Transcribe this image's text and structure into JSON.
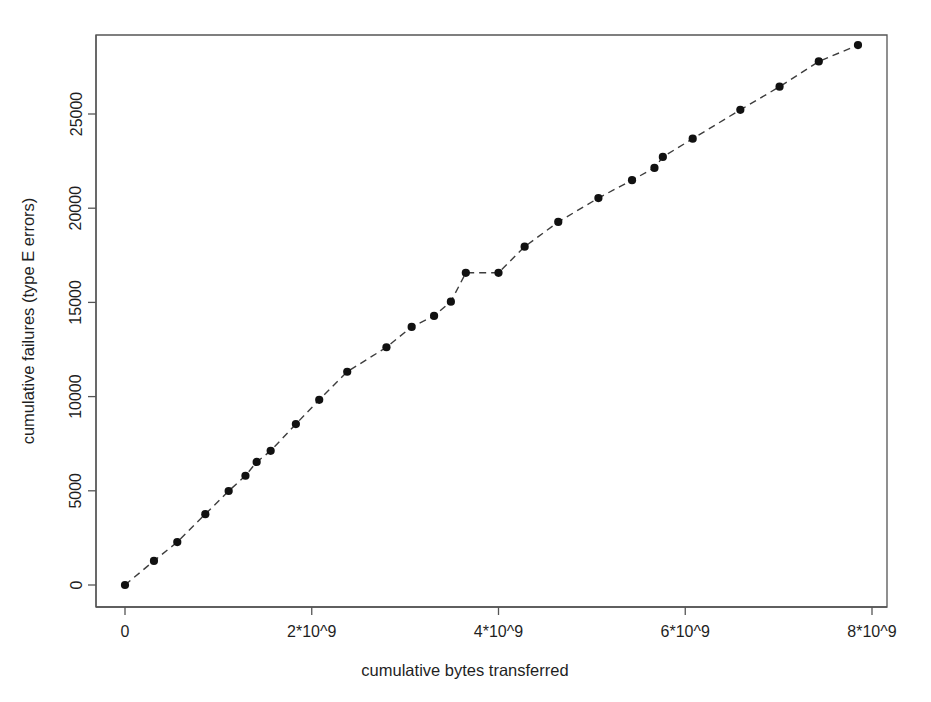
{
  "chart_data": {
    "type": "scatter",
    "title": "",
    "xlabel": "cumulative bytes transferred",
    "ylabel": "cumulative failures (type E errors)",
    "xlim": [
      -350000000.0,
      8150000000.0
    ],
    "ylim": [
      -900,
      29600
    ],
    "xticks": [
      0,
      2000000000,
      4000000000,
      6000000000,
      8000000000
    ],
    "xtick_labels": [
      "0",
      "2*10^9",
      "4*10^9",
      "6*10^9",
      "8*10^9"
    ],
    "yticks": [
      0,
      5000,
      10000,
      15000,
      20000,
      25000
    ],
    "ytick_labels": [
      "0",
      "5000",
      "10000",
      "15000",
      "20000",
      "25000"
    ],
    "grid": false,
    "legend": null,
    "line_style": "dashed",
    "marker": "filled-circle",
    "point_color": "#111111",
    "line_color": "#3d3d3d",
    "series": [
      {
        "name": "cumulative failures",
        "x": [
          0,
          310000000,
          560000000,
          860000000,
          1110000000,
          1290000000,
          1410000000,
          1560000000,
          1830000000,
          2080000000,
          2380000000,
          2800000000,
          3070000000,
          3310000000,
          3490000000,
          3650000000,
          4000000000,
          4280000000,
          4640000000,
          5070000000,
          5430000000,
          5670000000,
          5760000000,
          6080000000,
          6590000000,
          7010000000,
          7430000000,
          7850000000
        ],
        "y": [
          0,
          1280,
          2280,
          3760,
          4990,
          5800,
          6530,
          7120,
          8540,
          9830,
          11320,
          12620,
          13700,
          14280,
          15040,
          16570,
          16570,
          17960,
          19270,
          20540,
          21490,
          22140,
          22720,
          23690,
          25220,
          26450,
          27790,
          28660
        ]
      }
    ]
  }
}
